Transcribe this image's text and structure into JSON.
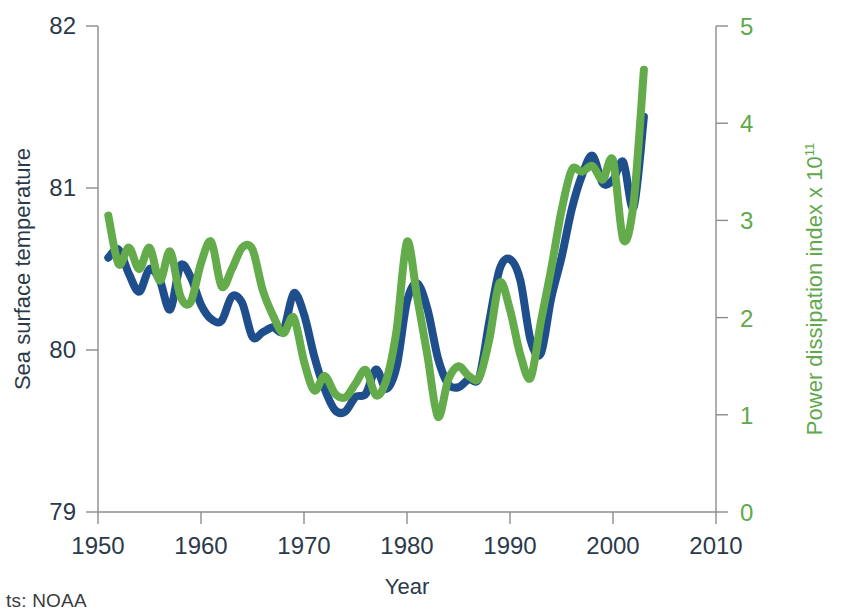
{
  "chart_data": {
    "type": "line",
    "title": "",
    "xlabel": "Year",
    "ylabel": "Sea surface temperature",
    "ylabel_right": "Power dissipation index x 10",
    "ylabel_right_sup": "11",
    "xlim": [
      1950,
      2010
    ],
    "ylim": [
      79,
      82
    ],
    "ylim_right": [
      0,
      5
    ],
    "xticks": [
      1950,
      1960,
      1970,
      1980,
      1990,
      2000,
      2010
    ],
    "yticks": [
      79,
      80,
      81,
      82
    ],
    "yticks_right": [
      0,
      1,
      2,
      3,
      4,
      5
    ],
    "grid": false,
    "legend": "none",
    "colors": {
      "sst": "#1f4e8c",
      "pdi": "#63ab4b",
      "axis": "#8c8c8c",
      "text": "#2b3a4a"
    },
    "series": [
      {
        "name": "Sea surface temperature",
        "axis": "left",
        "color": "#1f4e8c",
        "x": [
          1951,
          1952,
          1953,
          1954,
          1955,
          1956,
          1957,
          1958,
          1959,
          1960,
          1961,
          1962,
          1963,
          1964,
          1965,
          1966,
          1967,
          1968,
          1969,
          1970,
          1971,
          1972,
          1973,
          1974,
          1975,
          1976,
          1977,
          1978,
          1979,
          1980,
          1981,
          1982,
          1983,
          1984,
          1985,
          1986,
          1987,
          1988,
          1989,
          1990,
          1991,
          1992,
          1993,
          1994,
          1995,
          1996,
          1997,
          1998,
          1999,
          2000,
          2001,
          2002,
          2003
        ],
        "values": [
          80.57,
          80.62,
          80.47,
          80.36,
          80.5,
          80.43,
          80.25,
          80.52,
          80.45,
          80.28,
          80.19,
          80.18,
          80.33,
          80.29,
          80.08,
          80.11,
          80.14,
          80.12,
          80.35,
          80.22,
          79.96,
          79.76,
          79.63,
          79.62,
          79.71,
          79.73,
          79.88,
          79.76,
          79.9,
          80.3,
          80.41,
          80.25,
          79.95,
          79.79,
          79.77,
          79.82,
          79.83,
          80.18,
          80.5,
          80.56,
          80.43,
          80.06,
          79.98,
          80.32,
          80.57,
          80.87,
          81.08,
          81.2,
          81.03,
          81.05,
          81.16,
          80.88,
          81.44
        ]
      },
      {
        "name": "Power dissipation index",
        "axis": "right",
        "color": "#63ab4b",
        "x": [
          1951,
          1952,
          1953,
          1954,
          1955,
          1956,
          1957,
          1958,
          1959,
          1960,
          1961,
          1962,
          1963,
          1964,
          1965,
          1966,
          1967,
          1968,
          1969,
          1970,
          1971,
          1972,
          1973,
          1974,
          1975,
          1976,
          1977,
          1978,
          1979,
          1980,
          1981,
          1982,
          1983,
          1984,
          1985,
          1986,
          1987,
          1988,
          1989,
          1990,
          1991,
          1992,
          1993,
          1994,
          1995,
          1996,
          1997,
          1998,
          1999,
          2000,
          2001,
          2002,
          2003
        ],
        "values": [
          3.05,
          2.55,
          2.72,
          2.5,
          2.72,
          2.38,
          2.68,
          2.22,
          2.16,
          2.56,
          2.78,
          2.32,
          2.5,
          2.72,
          2.7,
          2.28,
          2.02,
          1.84,
          2.0,
          1.55,
          1.25,
          1.4,
          1.22,
          1.18,
          1.32,
          1.46,
          1.2,
          1.36,
          1.88,
          2.78,
          2.2,
          1.6,
          0.98,
          1.36,
          1.5,
          1.4,
          1.38,
          1.78,
          2.36,
          2.08,
          1.62,
          1.38,
          1.96,
          2.5,
          3.1,
          3.52,
          3.5,
          3.56,
          3.42,
          3.62,
          2.8,
          3.18,
          4.55
        ]
      }
    ]
  },
  "credit": {
    "text": "ts: NOAA"
  }
}
